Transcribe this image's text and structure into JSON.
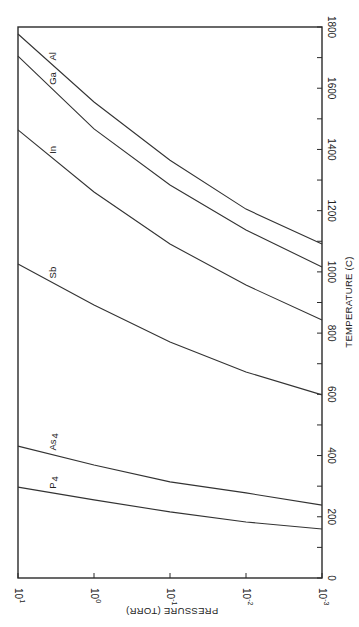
{
  "chart_data": {
    "type": "line",
    "orientation": "rotated 90deg clockwise (temperature axis runs vertically on right, pressure axis runs horizontally along bottom)",
    "title": "",
    "xlabel": "TEMPERATURE (C)",
    "ylabel": "PRESSURE (TORR)",
    "xlim": [
      0,
      1800
    ],
    "ylim_log10": [
      -3,
      1
    ],
    "x_ticks": [
      "0",
      "200",
      "400",
      "600",
      "800",
      "1000",
      "1200",
      "1400",
      "1600",
      "1800"
    ],
    "y_ticks": [
      "10^-3",
      "10^-2",
      "10^-1",
      "10^0",
      "10^1"
    ],
    "y_tick_labels": [
      {
        "base": "10",
        "exp": "-3"
      },
      {
        "base": "10",
        "exp": "-2"
      },
      {
        "base": "10",
        "exp": "-1"
      },
      {
        "base": "10",
        "exp": "0"
      },
      {
        "base": "10",
        "exp": "1"
      }
    ],
    "grid": false,
    "legend": "inline labels on curves",
    "log10_pressure": [
      -3,
      -2,
      -1,
      0,
      1
    ],
    "series": [
      {
        "name": "P4",
        "label_main": "P",
        "label_sub": "4",
        "temperature_C": [
          160,
          183,
          216,
          255,
          297
        ]
      },
      {
        "name": "As4",
        "label_main": "As",
        "label_sub": "4",
        "temperature_C": [
          238,
          278,
          314,
          369,
          431
        ]
      },
      {
        "name": "Sb",
        "label_main": "Sb",
        "label_sub": "",
        "temperature_C": [
          598,
          673,
          771,
          892,
          1026
        ]
      },
      {
        "name": "In",
        "label_main": "In",
        "label_sub": "",
        "temperature_C": [
          843,
          957,
          1091,
          1261,
          1464
        ]
      },
      {
        "name": "Ga",
        "label_main": "Ga",
        "label_sub": "",
        "temperature_C": [
          1016,
          1137,
          1284,
          1467,
          1705
        ]
      },
      {
        "name": "Al",
        "label_main": "Al",
        "label_sub": "",
        "temperature_C": [
          1091,
          1205,
          1365,
          1555,
          1777
        ]
      }
    ]
  },
  "labels": {
    "x_axis": "TEMPERATURE (C)",
    "y_axis": "PRESSURE (TORR)"
  }
}
